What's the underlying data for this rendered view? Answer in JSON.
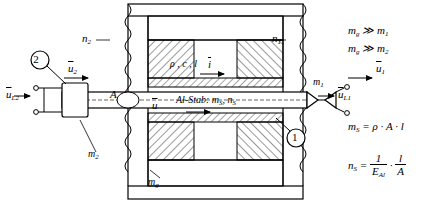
{
  "figure": {
    "labels": {
      "n2_top": "n",
      "n2_top_sub": "2",
      "n1_top": "n",
      "n1_top_sub": "1",
      "rho_c_l": "ρ , c , l",
      "current_i": "i",
      "m1": "m",
      "m1_sub": "1",
      "u2": "u",
      "u2_sub": "2",
      "uL2": "u",
      "uL2_sub": "L2",
      "uL1": "u",
      "uL1_sub": "L1",
      "u1": "u",
      "u1_sub": "1",
      "u_mid": "u",
      "area_A": "A",
      "al_stab": "Al-Stab: m",
      "al_stab_sub1": "S",
      "al_stab_mid": ", n",
      "al_stab_sub2": "S",
      "m2": "m",
      "m2_sub": "2",
      "mg": "m",
      "mg_sub": "g",
      "callout_2": "2",
      "callout_1": "1"
    },
    "equations": {
      "ineq1_left": "m",
      "ineq1_left_sub": "g",
      "ineq1_rel": " ≫ m",
      "ineq1_right_sub": "1",
      "ineq2_left": "m",
      "ineq2_left_sub": "g",
      "ineq2_rel": " ≫ m",
      "ineq2_right_sub": "2",
      "ms_lhs": "m",
      "ms_lhs_sub": "S",
      "ms_rhs": " = ρ · A · l",
      "ns_lhs": "n",
      "ns_lhs_sub": "S",
      "ns_eq": " = ",
      "ns_frac_num": "1",
      "ns_frac_den": "E",
      "ns_frac_den_sub": "Al",
      "ns_dot": " · ",
      "ns_frac2_num": "l",
      "ns_frac2_den": "A"
    },
    "colors": {
      "line": "#000000",
      "hatch": "#000000",
      "background": "#ffffff"
    }
  }
}
